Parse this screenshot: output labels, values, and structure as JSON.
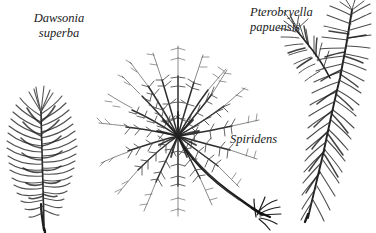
{
  "figure": {
    "background_color": "#ffffff",
    "ink_color": "#2b2b2b",
    "width": 376,
    "height": 233,
    "caption_style": "italic-serif"
  },
  "labels": {
    "dawsonia": {
      "genus": "Dawsonia",
      "species": "superba"
    },
    "pterobryella": {
      "genus": "Pterobryella",
      "species": "papuensis"
    },
    "spiridens": {
      "genus": "Spiridens"
    }
  },
  "specimens": [
    {
      "name": "dawsonia-superba",
      "form": "erect feather-like plume with narrow upward-curving leaves on a single axis",
      "position": "left"
    },
    {
      "name": "spiridens",
      "form": "radial rosette of pinnate fronds on a curved stem ending in a rhizoid tuft",
      "position": "center"
    },
    {
      "name": "pterobryella-papuensis",
      "form": "forked pinnate stem with two ascending tips",
      "position": "right"
    }
  ]
}
